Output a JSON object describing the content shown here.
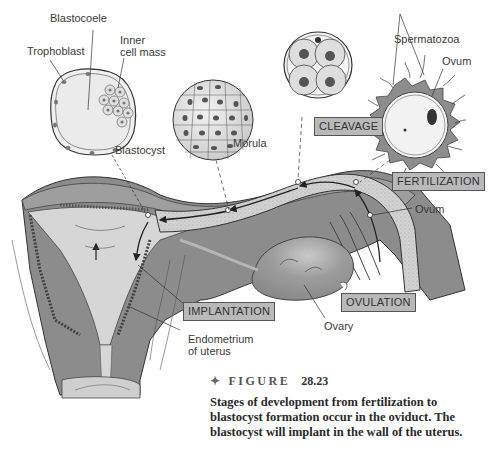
{
  "diagram": {
    "title": "Stages of development from fertilization to blastocyst formation",
    "labels": {
      "blastocoele": "Blastocoele",
      "trophoblast": "Trophoblast",
      "inner_cell_mass_line1": "Inner",
      "inner_cell_mass_line2": "cell mass",
      "blastocyst": "Blastocyst",
      "morula": "Morula",
      "spermatozoa": "Spermatozoa",
      "ovum_top": "Ovum",
      "ovum_tube": "Ovum",
      "ovary": "Ovary",
      "endometrium_line1": "Endometrium",
      "endometrium_line2": "of uterus"
    },
    "stages": [
      {
        "id": "cleavage",
        "label": "CLEAVAGE"
      },
      {
        "id": "fertilization",
        "label": "FERTILIZATION"
      },
      {
        "id": "implantation",
        "label": "IMPLANTATION"
      },
      {
        "id": "ovulation",
        "label": "OVULATION"
      }
    ],
    "colors": {
      "tissue_dark": "#8c8c8c",
      "tissue_mid": "#a6a6a6",
      "lumen_light": "#d6d6d6",
      "label_box": "#b9b9b9",
      "line": "#333333"
    }
  },
  "caption": {
    "figure_label": "FIGURE",
    "figure_number": "28.23",
    "text": "Stages of development from fertilization to blastocyst formation occur in the oviduct. The blastocyst will implant in the wall of the uterus."
  }
}
